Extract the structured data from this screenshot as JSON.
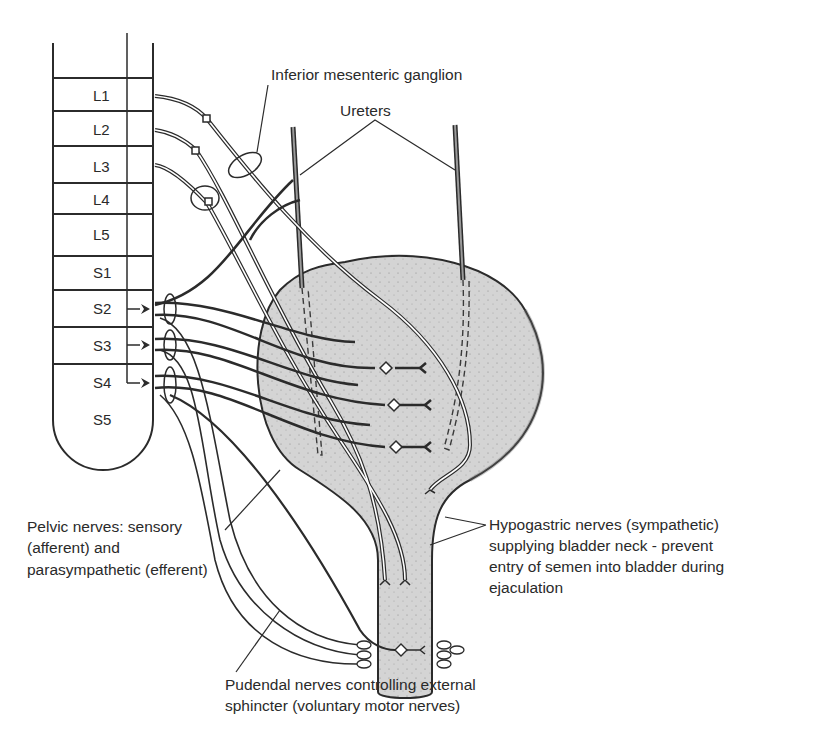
{
  "diagram": {
    "spinal_segments": [
      "L1",
      "L2",
      "L3",
      "L4",
      "L5",
      "S1",
      "S2",
      "S3",
      "S4",
      "S5"
    ],
    "labels": {
      "inferior_mesenteric_ganglion": "Inferior mesenteric ganglion",
      "ureters": "Ureters",
      "pelvic_nerves": [
        "Pelvic nerves: sensory",
        "(afferent) and",
        "parasympathetic (efferent)"
      ],
      "hypogastric_nerves": [
        "Hypogastric nerves (sympathetic)",
        "supplying bladder neck - prevent",
        "entry of semen into bladder during",
        "ejaculation"
      ],
      "pudendal_nerves": [
        "Pudendal nerves controlling external",
        "sphincter (voluntary motor nerves)"
      ]
    },
    "colors": {
      "line": "#2b2b2b",
      "bladder_fill": "#d6d6d6",
      "background": "#ffffff"
    }
  }
}
